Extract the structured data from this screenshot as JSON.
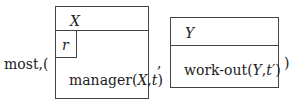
{
  "prefix": "most,(",
  "separator": ",",
  "closing": ")",
  "drs1": {
    "referent": "X",
    "inner_box_label": "r",
    "condition": {
      "predicate": "manager(",
      "arg1": "X",
      "comma": ",",
      "arg2": "t",
      "close": ")"
    }
  },
  "drs2": {
    "referent": "Y",
    "condition": {
      "predicate": "work-out(",
      "arg1": "Y",
      "comma": ",",
      "arg2": "t′",
      "close": ")"
    }
  }
}
